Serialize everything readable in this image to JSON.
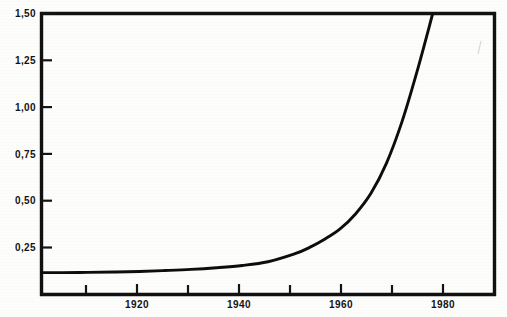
{
  "chart_data": {
    "type": "line",
    "title": "",
    "subtitle": "",
    "xlabel": "",
    "ylabel": "",
    "xlim": [
      1901,
      1989
    ],
    "ylim": [
      0.0,
      1.5
    ],
    "grid": false,
    "legend": null,
    "decimal_separator": ",",
    "y_ticks": [
      0.25,
      0.5,
      0.75,
      1.0,
      1.25,
      1.5
    ],
    "y_tick_labels": [
      "0,25",
      "0,50",
      "0,75",
      "1,00",
      "1,25",
      "1,50"
    ],
    "x_ticks_major": [
      1920,
      1940,
      1960,
      1980
    ],
    "x_tick_labels": [
      "1920",
      "1940",
      "1960",
      "1980"
    ],
    "x_ticks_minor": [
      1910,
      1930,
      1950,
      1970
    ],
    "series": [
      {
        "name": "curve",
        "x": [
          1901,
          1905,
          1910,
          1915,
          1920,
          1925,
          1930,
          1935,
          1940,
          1945,
          1950,
          1953,
          1956,
          1959,
          1962,
          1965,
          1968,
          1971,
          1974,
          1977
        ],
        "y": [
          0.117,
          0.117,
          0.118,
          0.12,
          0.123,
          0.128,
          0.134,
          0.143,
          0.155,
          0.175,
          0.215,
          0.25,
          0.295,
          0.35,
          0.43,
          0.54,
          0.7,
          0.92,
          1.195,
          1.5
        ]
      }
    ],
    "annotations": []
  },
  "axes": {
    "frame_color": "#111111",
    "tick_color": "#141414",
    "curve_color": "#0d0d0d",
    "background": "#fdfdfc"
  },
  "figure": {
    "width": 507,
    "height": 317
  }
}
